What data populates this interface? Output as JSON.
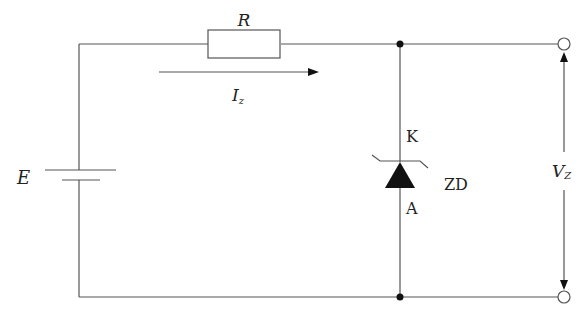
{
  "diagram": {
    "type": "zener-diode-voltage-regulator",
    "labels": {
      "resistor": "R",
      "current": "I",
      "current_sub": "z",
      "source": "E",
      "cathode": "K",
      "anode": "A",
      "diode": "ZD",
      "voltage": "V",
      "voltage_sub": "Z"
    },
    "colors": {
      "wire": "#555555",
      "fill": "#111111",
      "background": "#ffffff"
    }
  }
}
